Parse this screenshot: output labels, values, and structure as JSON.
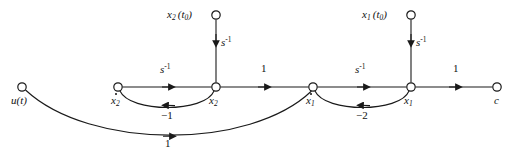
{
  "diagram": {
    "stroke_color": "#1a1a1a",
    "background": "#ffffff",
    "nodes": [
      {
        "id": "u",
        "label_text": "u(t)",
        "base": "u",
        "sub": "",
        "paren": "(t)",
        "x": 22,
        "y": 87,
        "r": 4.2,
        "label_pos": "below-left"
      },
      {
        "id": "x2dot",
        "label_text": "x2",
        "base": "x",
        "sub": "2",
        "paren": "",
        "x": 118,
        "y": 87,
        "r": 4.2,
        "label_pos": "below",
        "dot": true
      },
      {
        "id": "x2",
        "label_text": "x2",
        "base": "x",
        "sub": "2",
        "paren": "",
        "x": 216,
        "y": 87,
        "r": 4.2,
        "label_pos": "below",
        "dot": false
      },
      {
        "id": "x1dot",
        "label_text": "x1",
        "base": "x",
        "sub": "1",
        "paren": "",
        "x": 313,
        "y": 87,
        "r": 4.2,
        "label_pos": "below",
        "dot": true
      },
      {
        "id": "x1",
        "label_text": "x1",
        "base": "x",
        "sub": "1",
        "paren": "",
        "x": 411,
        "y": 87,
        "r": 4.2,
        "label_pos": "below",
        "dot": false
      },
      {
        "id": "c",
        "label_text": "c",
        "base": "c",
        "sub": "",
        "paren": "",
        "x": 497,
        "y": 87,
        "r": 4.2,
        "label_pos": "below"
      },
      {
        "id": "ic_x2",
        "label_text": "x2(t0)",
        "base": "x",
        "sub": "2",
        "paren": "(t0)",
        "x": 216,
        "y": 15,
        "r": 4.2,
        "label_pos": "left"
      },
      {
        "id": "ic_x1",
        "label_text": "x1(t0)",
        "base": "x",
        "sub": "1",
        "paren": "(t0)",
        "x": 411,
        "y": 15,
        "r": 4.2,
        "label_pos": "left"
      }
    ],
    "edges": [
      {
        "id": "e-x2dot-x2",
        "from": "x2dot",
        "to": "x2",
        "gain": "s-1",
        "gain_display": "s",
        "gain_sup": "-1",
        "shape": "straight",
        "label_pos": "above"
      },
      {
        "id": "e-x2-x1dot",
        "from": "x2",
        "to": "x1dot",
        "gain": "1",
        "gain_display": "1",
        "gain_sup": "",
        "shape": "straight",
        "label_pos": "above"
      },
      {
        "id": "e-x1dot-x1",
        "from": "x1dot",
        "to": "x1",
        "gain": "s-1",
        "gain_display": "s",
        "gain_sup": "-1",
        "shape": "straight",
        "label_pos": "above"
      },
      {
        "id": "e-x1-c",
        "from": "x1",
        "to": "c",
        "gain": "1",
        "gain_display": "1",
        "gain_sup": "",
        "shape": "straight",
        "label_pos": "above"
      },
      {
        "id": "e-ic-x2",
        "from": "ic_x2",
        "to": "x2",
        "gain": "s-1",
        "gain_display": "s",
        "gain_sup": "-1",
        "shape": "vertical",
        "label_pos": "right"
      },
      {
        "id": "e-ic-x1",
        "from": "ic_x1",
        "to": "x1",
        "gain": "s-1",
        "gain_display": "s",
        "gain_sup": "-1",
        "shape": "vertical",
        "label_pos": "right"
      },
      {
        "id": "e-fb-x2",
        "from": "x2",
        "to": "x2dot",
        "gain": "-1",
        "gain_display": "−1",
        "gain_sup": "",
        "shape": "curve-below",
        "label_pos": "below"
      },
      {
        "id": "e-fb-x1",
        "from": "x1",
        "to": "x1dot",
        "gain": "-2",
        "gain_display": "−2",
        "gain_sup": "",
        "shape": "curve-below",
        "label_pos": "below"
      },
      {
        "id": "e-u-x1dot",
        "from": "u",
        "to": "x1dot",
        "gain": "1",
        "gain_display": "1",
        "gain_sup": "",
        "shape": "long-curve-below",
        "label_pos": "below"
      }
    ],
    "branch_labels": {
      "s_inverse": "s",
      "s_inverse_exp": "-1",
      "unity": "1",
      "minus_one": "−1",
      "minus_two": "−2"
    }
  }
}
